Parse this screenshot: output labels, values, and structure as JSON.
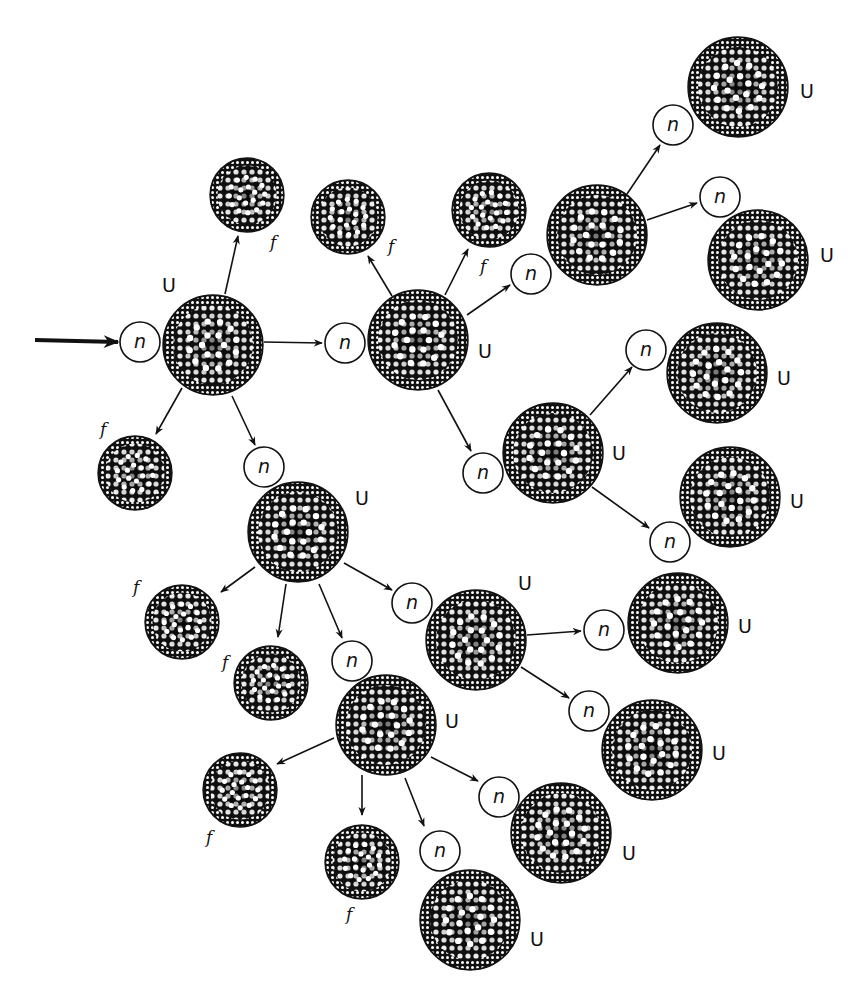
{
  "diagram": {
    "type": "nuclear-fission-chain-reaction",
    "labels": {
      "uranium": "U",
      "fragment": "f",
      "neutron": "n"
    },
    "colors": {
      "ink": "#111111",
      "background": "#ffffff",
      "dot": "#ffffff"
    },
    "incoming_arrow": {
      "x1": 35,
      "y1": 340,
      "x2": 118,
      "y2": 342
    },
    "nuclei": [
      {
        "id": "U1",
        "kind": "U",
        "cx": 213,
        "cy": 345,
        "r": 50,
        "label": "U",
        "lx": 162,
        "ly": 292
      },
      {
        "id": "f1",
        "kind": "f",
        "cx": 247,
        "cy": 195,
        "r": 37,
        "label": "f",
        "lx": 270,
        "ly": 248
      },
      {
        "id": "f2",
        "kind": "f",
        "cx": 135,
        "cy": 473,
        "r": 37,
        "label": "f",
        "lx": 100,
        "ly": 435
      },
      {
        "id": "U2",
        "kind": "U",
        "cx": 418,
        "cy": 340,
        "r": 50,
        "label": "U",
        "lx": 478,
        "ly": 358
      },
      {
        "id": "f3",
        "kind": "f",
        "cx": 348,
        "cy": 217,
        "r": 37,
        "label": "f",
        "lx": 388,
        "ly": 252
      },
      {
        "id": "f4",
        "kind": "f",
        "cx": 489,
        "cy": 210,
        "r": 37,
        "label": "f",
        "lx": 480,
        "ly": 272
      },
      {
        "id": "U3",
        "kind": "U",
        "cx": 597,
        "cy": 235,
        "r": 50,
        "label": "",
        "lx": 0,
        "ly": 0
      },
      {
        "id": "U4",
        "kind": "U",
        "cx": 738,
        "cy": 87,
        "r": 50,
        "label": "U",
        "lx": 800,
        "ly": 98
      },
      {
        "id": "U5",
        "kind": "U",
        "cx": 758,
        "cy": 260,
        "r": 50,
        "label": "U",
        "lx": 820,
        "ly": 262
      },
      {
        "id": "U6",
        "kind": "U",
        "cx": 553,
        "cy": 453,
        "r": 50,
        "label": "U",
        "lx": 612,
        "ly": 460
      },
      {
        "id": "U7",
        "kind": "U",
        "cx": 717,
        "cy": 373,
        "r": 50,
        "label": "U",
        "lx": 777,
        "ly": 385
      },
      {
        "id": "U8",
        "kind": "U",
        "cx": 730,
        "cy": 497,
        "r": 50,
        "label": "U",
        "lx": 790,
        "ly": 508
      },
      {
        "id": "U9",
        "kind": "U",
        "cx": 298,
        "cy": 532,
        "r": 50,
        "label": "U",
        "lx": 355,
        "ly": 505
      },
      {
        "id": "f5",
        "kind": "f",
        "cx": 182,
        "cy": 622,
        "r": 37,
        "label": "f",
        "lx": 133,
        "ly": 593
      },
      {
        "id": "f6",
        "kind": "f",
        "cx": 271,
        "cy": 683,
        "r": 37,
        "label": "f",
        "lx": 222,
        "ly": 668
      },
      {
        "id": "U10",
        "kind": "U",
        "cx": 476,
        "cy": 640,
        "r": 50,
        "label": "U",
        "lx": 518,
        "ly": 590
      },
      {
        "id": "U11",
        "kind": "U",
        "cx": 678,
        "cy": 623,
        "r": 50,
        "label": "U",
        "lx": 738,
        "ly": 633
      },
      {
        "id": "U12",
        "kind": "U",
        "cx": 652,
        "cy": 750,
        "r": 50,
        "label": "U",
        "lx": 712,
        "ly": 760
      },
      {
        "id": "U13",
        "kind": "U",
        "cx": 386,
        "cy": 725,
        "r": 50,
        "label": "U",
        "lx": 445,
        "ly": 728
      },
      {
        "id": "f7",
        "kind": "f",
        "cx": 240,
        "cy": 790,
        "r": 37,
        "label": "f",
        "lx": 206,
        "ly": 843
      },
      {
        "id": "f8",
        "kind": "f",
        "cx": 362,
        "cy": 862,
        "r": 37,
        "label": "f",
        "lx": 346,
        "ly": 920
      },
      {
        "id": "U14",
        "kind": "U",
        "cx": 561,
        "cy": 833,
        "r": 50,
        "label": "U",
        "lx": 622,
        "ly": 860
      },
      {
        "id": "U15",
        "kind": "U",
        "cx": 470,
        "cy": 920,
        "r": 50,
        "label": "U",
        "lx": 530,
        "ly": 946
      }
    ],
    "neutrons": [
      {
        "id": "n0",
        "cx": 140,
        "cy": 342,
        "r": 20,
        "label": "n"
      },
      {
        "id": "n1",
        "cx": 345,
        "cy": 343,
        "r": 20,
        "label": "n"
      },
      {
        "id": "n2",
        "cx": 264,
        "cy": 467,
        "r": 20,
        "label": "n"
      },
      {
        "id": "n3",
        "cx": 531,
        "cy": 274,
        "r": 20,
        "label": "n"
      },
      {
        "id": "n4",
        "cx": 483,
        "cy": 473,
        "r": 20,
        "label": "n"
      },
      {
        "id": "n5",
        "cx": 673,
        "cy": 125,
        "r": 20,
        "label": "n"
      },
      {
        "id": "n6",
        "cx": 720,
        "cy": 197,
        "r": 20,
        "label": "n"
      },
      {
        "id": "n7",
        "cx": 646,
        "cy": 350,
        "r": 20,
        "label": "n"
      },
      {
        "id": "n8",
        "cx": 670,
        "cy": 542,
        "r": 20,
        "label": "n"
      },
      {
        "id": "n9",
        "cx": 412,
        "cy": 603,
        "r": 20,
        "label": "n"
      },
      {
        "id": "n10",
        "cx": 352,
        "cy": 661,
        "r": 20,
        "label": "n"
      },
      {
        "id": "n11",
        "cx": 604,
        "cy": 630,
        "r": 20,
        "label": "n"
      },
      {
        "id": "n12",
        "cx": 589,
        "cy": 711,
        "r": 20,
        "label": "n"
      },
      {
        "id": "n13",
        "cx": 499,
        "cy": 797,
        "r": 20,
        "label": "n"
      },
      {
        "id": "n14",
        "cx": 440,
        "cy": 851,
        "r": 20,
        "label": "n"
      }
    ],
    "arrows": [
      {
        "x1": 225,
        "y1": 294,
        "x2": 238,
        "y2": 236
      },
      {
        "x1": 182,
        "y1": 388,
        "x2": 156,
        "y2": 434
      },
      {
        "x1": 264,
        "y1": 342,
        "x2": 322,
        "y2": 343
      },
      {
        "x1": 232,
        "y1": 396,
        "x2": 255,
        "y2": 445
      },
      {
        "x1": 392,
        "y1": 296,
        "x2": 368,
        "y2": 256
      },
      {
        "x1": 445,
        "y1": 295,
        "x2": 468,
        "y2": 249
      },
      {
        "x1": 467,
        "y1": 315,
        "x2": 510,
        "y2": 285
      },
      {
        "x1": 438,
        "y1": 390,
        "x2": 471,
        "y2": 451
      },
      {
        "x1": 627,
        "y1": 194,
        "x2": 660,
        "y2": 145
      },
      {
        "x1": 647,
        "y1": 220,
        "x2": 697,
        "y2": 203
      },
      {
        "x1": 590,
        "y1": 415,
        "x2": 632,
        "y2": 367
      },
      {
        "x1": 592,
        "y1": 487,
        "x2": 649,
        "y2": 528
      },
      {
        "x1": 255,
        "y1": 567,
        "x2": 221,
        "y2": 592
      },
      {
        "x1": 286,
        "y1": 584,
        "x2": 278,
        "y2": 637
      },
      {
        "x1": 319,
        "y1": 584,
        "x2": 342,
        "y2": 638
      },
      {
        "x1": 344,
        "y1": 563,
        "x2": 392,
        "y2": 590
      },
      {
        "x1": 527,
        "y1": 635,
        "x2": 581,
        "y2": 631
      },
      {
        "x1": 521,
        "y1": 667,
        "x2": 569,
        "y2": 698
      },
      {
        "x1": 334,
        "y1": 738,
        "x2": 277,
        "y2": 764
      },
      {
        "x1": 362,
        "y1": 775,
        "x2": 362,
        "y2": 815
      },
      {
        "x1": 405,
        "y1": 778,
        "x2": 424,
        "y2": 826
      },
      {
        "x1": 431,
        "y1": 757,
        "x2": 478,
        "y2": 781
      }
    ]
  }
}
